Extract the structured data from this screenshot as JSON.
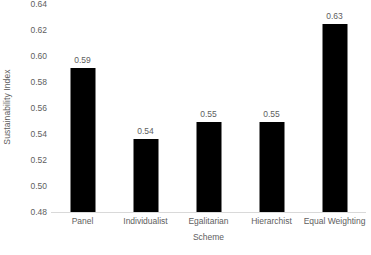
{
  "chart_data": {
    "type": "bar",
    "title": "",
    "xlabel": "Scheme",
    "ylabel": "Sustainability Index",
    "categories": [
      "Panel",
      "Individualist",
      "Egalitarian",
      "Hierarchist",
      "Equal Weighting"
    ],
    "values": [
      0.591,
      0.536,
      0.549,
      0.549,
      0.625
    ],
    "data_labels": [
      "0.59",
      "0.54",
      "0.55",
      "0.55",
      "0.63"
    ],
    "ylim": [
      0.48,
      0.64
    ],
    "ytick_step": 0.02,
    "ytick_labels": [
      "0.64",
      "0.62",
      "0.60",
      "0.58",
      "0.56",
      "0.54",
      "0.52",
      "0.50",
      "0.48"
    ],
    "ytick_values": [
      0.64,
      0.62,
      0.6,
      0.58,
      0.56,
      0.54,
      0.52,
      0.5,
      0.48
    ],
    "grid": false,
    "legend": false,
    "bar_color": "#000000",
    "axis_color": "#d9d9d9",
    "text_color": "#5e5e5e",
    "background": "#ffffff"
  }
}
